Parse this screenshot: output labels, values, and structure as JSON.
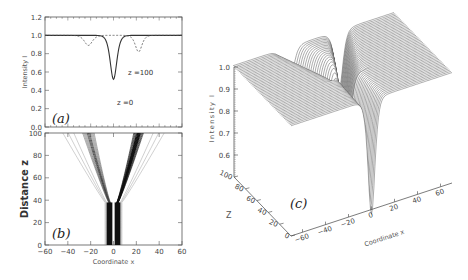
{
  "figure": {
    "panels": [
      {
        "id": "a",
        "label": "(a)"
      },
      {
        "id": "b",
        "label": "(b)"
      },
      {
        "id": "c",
        "label": "(c)"
      }
    ]
  },
  "chart_data": [
    {
      "panel": "(a)",
      "type": "line",
      "xlabel": "",
      "ylabel": "Intensity I",
      "xlim": [
        -60,
        60
      ],
      "ylim": [
        0.0,
        1.2
      ],
      "yticks": [
        "0.0",
        "0.2",
        "0.4",
        "0.6",
        "0.8",
        "1.0",
        "1.2"
      ],
      "series": [
        {
          "name": "z = 0",
          "style": "solid",
          "description": "single dark dip centered at x=0",
          "baseline": 1.0,
          "dips": [
            {
              "x": 0,
              "min": 0.52,
              "width": 5
            }
          ]
        },
        {
          "name": "z = 100",
          "style": "dashed",
          "description": "two split dips",
          "baseline": 1.0,
          "dips": [
            {
              "x": -22,
              "min": 0.89,
              "width": 6
            },
            {
              "x": 22,
              "min": 0.82,
              "width": 5
            }
          ]
        }
      ],
      "annotations": [
        "z =0",
        "z =100"
      ]
    },
    {
      "panel": "(b)",
      "type": "contour",
      "xlabel": "Coordinate x",
      "ylabel": "Distance z",
      "xlim": [
        -60,
        60
      ],
      "ylim": [
        0,
        100
      ],
      "xticks": [
        "-60",
        "-40",
        "-20",
        "0",
        "20",
        "40",
        "60"
      ],
      "yticks": [
        "0",
        "20",
        "40",
        "60",
        "80",
        "100"
      ],
      "description": "Dark soliton pair propagating together near x=0 until z≈40, then splitting into a V shape: weaker branch going to x≈-22 and stronger branch to x≈+22 at z=100"
    },
    {
      "panel": "(c)",
      "type": "surface",
      "xlabel": "Coordinate x",
      "ylabel": "Z",
      "zlabel": "Intensity I",
      "xticks": [
        "-60",
        "-40",
        "-20",
        "0",
        "20",
        "40",
        "60"
      ],
      "yticks": [
        "0",
        "20",
        "40",
        "60",
        "80",
        "100"
      ],
      "zticks": [
        "0.6",
        "0.7",
        "0.8",
        "0.9",
        "1.0"
      ],
      "description": "3D wireframe surface of intensity showing deep trench at x=0 for small Z that splits into two shallower grooves at large Z"
    }
  ],
  "axes": {
    "a": {
      "ylabel": "Intensity I",
      "yticks": [
        "0.0",
        "0.2",
        "0.4",
        "0.6",
        "0.8",
        "1.0",
        "1.2"
      ],
      "ann_z0": "z =0",
      "ann_z100": "z =100"
    },
    "b": {
      "ylabel": "Distance z",
      "xlabel": "Coordinate x",
      "yticks": [
        "0",
        "20",
        "40",
        "60",
        "80",
        "100"
      ],
      "xticks": [
        "-60",
        "-40",
        "-20",
        "0",
        "20",
        "40",
        "60"
      ]
    },
    "c": {
      "zlabel": "Intensity I",
      "ylabel": "Z",
      "xlabel": "Coordinate x",
      "zticks": [
        "1.0",
        "0.9",
        "0.8",
        "0.7",
        "0.6"
      ],
      "yticks": [
        "100",
        "80",
        "60",
        "40",
        "20",
        "0"
      ],
      "xticks": [
        "-60",
        "-40",
        "-20",
        "0",
        "20",
        "40",
        "60"
      ]
    }
  }
}
